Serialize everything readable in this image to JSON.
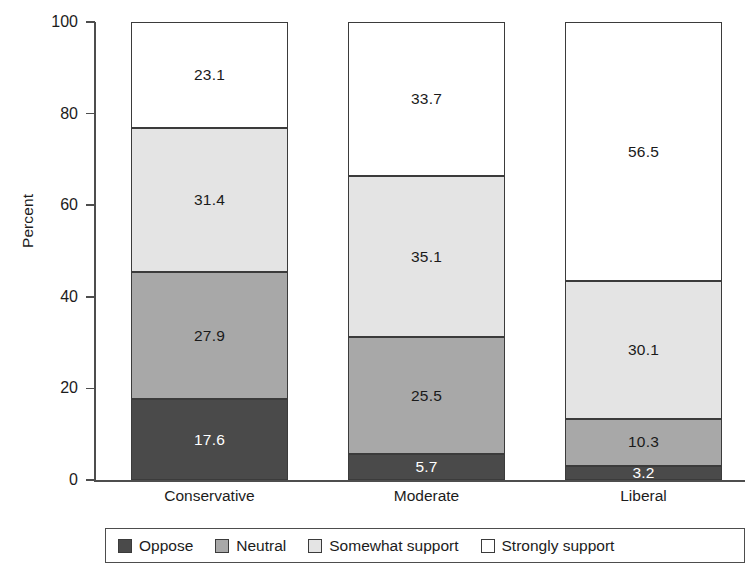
{
  "chart_data": {
    "type": "bar",
    "subtype": "stacked-100",
    "title": "",
    "xlabel": "",
    "ylabel": "Percent",
    "ylim": [
      0,
      100
    ],
    "yticks": [
      0,
      20,
      40,
      60,
      80,
      100
    ],
    "grid": false,
    "legend_position": "bottom",
    "categories": [
      "Conservative",
      "Moderate",
      "Liberal"
    ],
    "series": [
      {
        "name": "Oppose",
        "color": "#4a4a4a",
        "values": [
          17.6,
          5.7,
          3.2
        ]
      },
      {
        "name": "Neutral",
        "color": "#a8a8a8",
        "values": [
          27.9,
          25.5,
          10.3
        ]
      },
      {
        "name": "Somewhat support",
        "color": "#e4e4e4",
        "values": [
          31.4,
          35.1,
          30.1
        ]
      },
      {
        "name": "Strongly support",
        "color": "#ffffff",
        "values": [
          23.1,
          33.7,
          56.5
        ]
      }
    ]
  },
  "axis": {
    "y_title": "Percent",
    "y_tick_labels": [
      "100",
      "80",
      "60",
      "40",
      "20",
      "0"
    ]
  },
  "bars": [
    {
      "category": "Conservative",
      "segments": [
        {
          "series": "Strongly support",
          "value": "23.1",
          "tone": "tone-white"
        },
        {
          "series": "Somewhat support",
          "value": "31.4",
          "tone": "tone-light"
        },
        {
          "series": "Neutral",
          "value": "27.9",
          "tone": "tone-mid"
        },
        {
          "series": "Oppose",
          "value": "17.6",
          "tone": "tone-dark"
        }
      ]
    },
    {
      "category": "Moderate",
      "segments": [
        {
          "series": "Strongly support",
          "value": "33.7",
          "tone": "tone-white"
        },
        {
          "series": "Somewhat support",
          "value": "35.1",
          "tone": "tone-light"
        },
        {
          "series": "Neutral",
          "value": "25.5",
          "tone": "tone-mid"
        },
        {
          "series": "Oppose",
          "value": "5.7",
          "tone": "tone-dark"
        }
      ]
    },
    {
      "category": "Liberal",
      "segments": [
        {
          "series": "Strongly support",
          "value": "56.5",
          "tone": "tone-white"
        },
        {
          "series": "Somewhat support",
          "value": "30.1",
          "tone": "tone-light"
        },
        {
          "series": "Neutral",
          "value": "10.3",
          "tone": "tone-mid"
        },
        {
          "series": "Oppose",
          "value": "3.2",
          "tone": "tone-dark"
        }
      ]
    }
  ],
  "legend": {
    "items": [
      {
        "label": "Oppose",
        "tone": "tone-dark"
      },
      {
        "label": "Neutral",
        "tone": "tone-mid"
      },
      {
        "label": "Somewhat support",
        "tone": "tone-light"
      },
      {
        "label": "Strongly support",
        "tone": "tone-white"
      }
    ]
  }
}
